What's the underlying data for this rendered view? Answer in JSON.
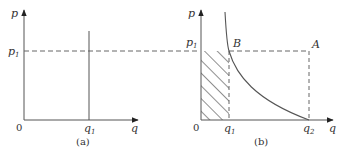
{
  "panels": [
    {
      "id": "a",
      "caption": "(a)",
      "y_axis_label": "p",
      "x_axis_label": "q",
      "origin_label": "0",
      "price_level": {
        "label": "p",
        "sub": "1"
      },
      "tick_labels": [
        {
          "label": "q",
          "sub": "1"
        }
      ],
      "elements": [
        "vertical supply line at q1",
        "dashed horizontal line at p1"
      ]
    },
    {
      "id": "b",
      "caption": "(b)",
      "y_axis_label": "p",
      "x_axis_label": "q",
      "origin_label": "0",
      "price_level": {
        "label": "p",
        "sub": "1"
      },
      "tick_labels": [
        {
          "label": "q",
          "sub": "1"
        },
        {
          "label": "q",
          "sub": "2"
        }
      ],
      "points": [
        {
          "label": "B"
        },
        {
          "label": "A"
        }
      ],
      "elements": [
        "hyperbolic demand curve",
        "hatched rectangle 0-q1 x 0-p1",
        "dashed lines to A"
      ]
    }
  ],
  "colors": {
    "line": "#555555",
    "dash": "#666666",
    "hatch": "#444444"
  }
}
